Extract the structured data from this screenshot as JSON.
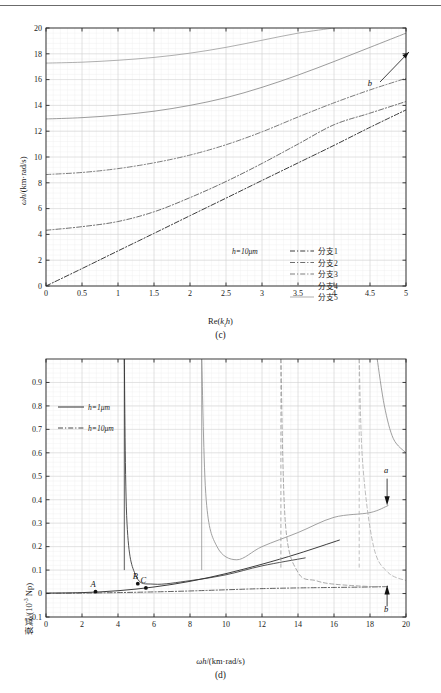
{
  "figure_c": {
    "caption": "(c)",
    "xlabel_html": "Re(<i>k<sub>t</sub>h</i>)",
    "ylabel_html": "<i>ωh</i>/(km·rad/s)",
    "legend_note": "h=10μm",
    "legend_items": [
      "分支1",
      "分支2",
      "分支3",
      "分支4",
      "分支5"
    ],
    "annotation": "b"
  },
  "figure_d": {
    "caption": "(d)",
    "xlabel_html": "<i>ωh</i>/(km·rad/s)",
    "ylabel_html": "衰减/(10<sup>-3</sup> Np)",
    "legend_items": [
      "h=1μm",
      "h=10μm"
    ],
    "point_labels": [
      "A",
      "B",
      "C"
    ],
    "annotations": [
      "a",
      "b"
    ]
  },
  "chart_data": [
    {
      "id": "c",
      "type": "line",
      "title": "",
      "xlabel": "Re(k_t h)",
      "ylabel": "ωh/(km·rad/s)",
      "xlim": [
        0,
        5
      ],
      "ylim": [
        0,
        20
      ],
      "xticks": [
        0,
        0.5,
        1,
        1.5,
        2,
        2.5,
        3,
        3.5,
        4,
        4.5,
        5
      ],
      "yticks": [
        0,
        2,
        4,
        6,
        8,
        10,
        12,
        14,
        16,
        18,
        20
      ],
      "grid": true,
      "legend_position": "center-right-inside",
      "legend_note": "h=10μm",
      "series": [
        {
          "name": "分支1",
          "style": "dashdot",
          "color": "#1a1a1a",
          "x": [
            0,
            0.5,
            1,
            1.5,
            2,
            2.5,
            3,
            3.5,
            4,
            4.5,
            5
          ],
          "values": [
            0,
            1.35,
            2.72,
            4.08,
            5.45,
            6.81,
            8.18,
            9.54,
            10.9,
            12.3,
            13.65
          ]
        },
        {
          "name": "分支2",
          "style": "dashdot",
          "color": "#555555",
          "x": [
            0,
            0.5,
            1,
            1.5,
            2,
            2.5,
            3,
            3.5,
            4,
            4.5,
            5
          ],
          "values": [
            4.32,
            4.6,
            5.0,
            5.75,
            6.85,
            8.1,
            9.5,
            11.0,
            12.5,
            13.4,
            14.3
          ]
        },
        {
          "name": "分支3",
          "style": "dashdot",
          "color": "#666666",
          "x": [
            0,
            0.5,
            1,
            1.5,
            2,
            2.5,
            3,
            3.5,
            4,
            4.5,
            5
          ],
          "values": [
            8.64,
            8.8,
            9.1,
            9.55,
            10.15,
            10.95,
            11.95,
            13.1,
            14.2,
            15.2,
            16.1
          ]
        },
        {
          "name": "分支4",
          "style": "solid",
          "color": "#8a8a8a",
          "x": [
            0,
            0.5,
            1,
            1.5,
            2,
            2.5,
            3,
            3.5,
            4,
            4.5,
            5
          ],
          "values": [
            12.95,
            13.05,
            13.25,
            13.55,
            14.0,
            14.6,
            15.4,
            16.35,
            17.4,
            18.5,
            19.6
          ]
        },
        {
          "name": "分支5",
          "style": "solid",
          "color": "#a0a0a0",
          "x": [
            0,
            0.5,
            1,
            1.5,
            2,
            2.5,
            3,
            3.5,
            4
          ],
          "values": [
            17.28,
            17.35,
            17.5,
            17.72,
            18.05,
            18.5,
            19.05,
            19.6,
            20.0
          ]
        }
      ]
    },
    {
      "id": "d",
      "type": "line",
      "title": "",
      "xlabel": "ωh/(km·rad/s)",
      "ylabel": "衰减/(10^-3 Np)",
      "xlim": [
        0,
        20
      ],
      "ylim": [
        -0.1,
        1.0
      ],
      "xticks": [
        0,
        2,
        4,
        6,
        8,
        10,
        12,
        14,
        16,
        18,
        20
      ],
      "yticks": [
        -0.1,
        0,
        0.1,
        0.2,
        0.3,
        0.4,
        0.5,
        0.6,
        0.7,
        0.8,
        0.9
      ],
      "grid": true,
      "legend_position": "upper-left-inside",
      "markers": [
        {
          "label": "A",
          "x": 2.75,
          "y": 0.008
        },
        {
          "label": "B",
          "x": 5.1,
          "y": 0.042
        },
        {
          "label": "C",
          "x": 5.55,
          "y": 0.024
        }
      ],
      "asymptotes": [
        4.35,
        8.65,
        13.05,
        17.4
      ],
      "series": [
        {
          "name": "h=1μm baseline",
          "style": "solid",
          "color": "#1a1a1a",
          "x": [
            0,
            2,
            4,
            6,
            8,
            10,
            12,
            14,
            16.3
          ],
          "values": [
            0.002,
            0.004,
            0.012,
            0.028,
            0.052,
            0.085,
            0.125,
            0.17,
            0.228
          ]
        },
        {
          "name": "h=10μm baseline",
          "style": "dashdot",
          "color": "#444444",
          "x": [
            0,
            2,
            4,
            6,
            8,
            10,
            12,
            14,
            16,
            18,
            19
          ],
          "values": [
            0.001,
            0.002,
            0.004,
            0.007,
            0.011,
            0.016,
            0.021,
            0.024,
            0.026,
            0.028,
            0.03
          ]
        },
        {
          "name": "branch-2 solid",
          "style": "solid",
          "color": "#333333",
          "x": [
            4.35,
            4.5,
            5,
            6,
            8,
            10,
            12,
            14.4
          ],
          "values": [
            1.0,
            0.3,
            0.075,
            0.04,
            0.055,
            0.08,
            0.118,
            0.152
          ]
        },
        {
          "name": "branch-3 grey",
          "style": "solid",
          "color": "#909090",
          "x": [
            8.65,
            8.9,
            9.5,
            10.6,
            12,
            14,
            16,
            18,
            19
          ],
          "values": [
            1.0,
            0.4,
            0.2,
            0.144,
            0.2,
            0.26,
            0.325,
            0.345,
            0.375
          ]
        },
        {
          "name": "branch-4 dashed",
          "style": "dashed",
          "color": "#9a9a9a",
          "x": [
            13.05,
            13.3,
            14,
            15,
            16,
            18,
            19
          ],
          "values": [
            1.0,
            0.3,
            0.09,
            0.055,
            0.04,
            0.03,
            0.03
          ]
        },
        {
          "name": "branch-5 dashed",
          "style": "dashed",
          "color": "#b0b0b0",
          "x": [
            17.4,
            17.6,
            18.2,
            19,
            20
          ],
          "values": [
            1.0,
            0.55,
            0.2,
            0.09,
            0.055
          ]
        },
        {
          "name": "branch-upper-right",
          "style": "solid",
          "color": "#8e8e8e",
          "x": [
            18.4,
            18.8,
            19.3,
            20
          ],
          "values": [
            1.0,
            0.8,
            0.66,
            0.6
          ]
        }
      ]
    }
  ]
}
